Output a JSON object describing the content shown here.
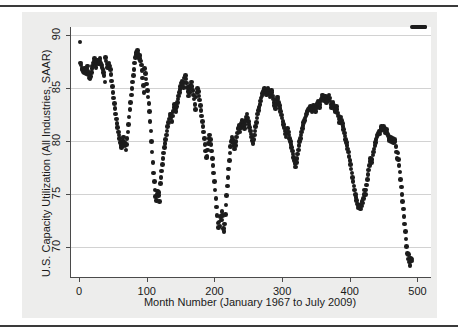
{
  "figure": {
    "background_color": "#ededec",
    "plot_background_color": "#ffffff",
    "axis_color": "#4a4a4a",
    "grid_color": "#d2d2d2",
    "marker_color": "#1c1c1c",
    "top_rule_color": "#3a3a3a",
    "bottom_rule_color": "#3a3a3a"
  },
  "chart_data": {
    "type": "scatter",
    "title": "",
    "xlabel": "Month Number (January 1967 to July 2009)",
    "ylabel": "U.S. Capacity Utilization  (All Industries, SAAR)",
    "xlim": [
      -12,
      520
    ],
    "ylim": [
      67.2,
      90.8
    ],
    "xticks": [
      0,
      100,
      200,
      300,
      400,
      500
    ],
    "xticklabels": [
      "0",
      "100",
      "200",
      "300",
      "400",
      "500"
    ],
    "yticks": [
      70,
      75,
      80,
      85,
      90
    ],
    "yticklabels": [
      "70",
      "75",
      "80",
      "85",
      "90"
    ],
    "grid": "horizontal",
    "legend": "none",
    "marker": "filled-circle",
    "n_points": 511,
    "x": [
      1,
      2,
      3,
      4,
      5,
      6,
      7,
      8,
      9,
      10,
      11,
      12,
      13,
      14,
      15,
      16,
      17,
      18,
      19,
      20,
      21,
      22,
      23,
      24,
      25,
      26,
      27,
      28,
      29,
      30,
      31,
      32,
      33,
      34,
      35,
      36,
      37,
      38,
      39,
      40,
      41,
      42,
      43,
      44,
      45,
      46,
      47,
      48,
      49,
      50,
      51,
      52,
      53,
      54,
      55,
      56,
      57,
      58,
      59,
      60,
      61,
      62,
      63,
      64,
      65,
      66,
      67,
      68,
      69,
      70,
      71,
      72,
      73,
      74,
      75,
      76,
      77,
      78,
      79,
      80,
      81,
      82,
      83,
      84,
      85,
      86,
      87,
      88,
      89,
      90,
      91,
      92,
      93,
      94,
      95,
      96,
      97,
      98,
      99,
      100,
      101,
      102,
      103,
      104,
      105,
      106,
      107,
      108,
      109,
      110,
      111,
      112,
      113,
      114,
      115,
      116,
      117,
      118,
      119,
      120,
      121,
      122,
      123,
      124,
      125,
      126,
      127,
      128,
      129,
      130,
      131,
      132,
      133,
      134,
      135,
      136,
      137,
      138,
      139,
      140,
      141,
      142,
      143,
      144,
      145,
      146,
      147,
      148,
      149,
      150,
      151,
      152,
      153,
      154,
      155,
      156,
      157,
      158,
      159,
      160,
      161,
      162,
      163,
      164,
      165,
      166,
      167,
      168,
      169,
      170,
      171,
      172,
      173,
      174,
      175,
      176,
      177,
      178,
      179,
      180,
      181,
      182,
      183,
      184,
      185,
      186,
      187,
      188,
      189,
      190,
      191,
      192,
      193,
      194,
      195,
      196,
      197,
      198,
      199,
      200,
      201,
      202,
      203,
      204,
      205,
      206,
      207,
      208,
      209,
      210,
      211,
      212,
      213,
      214,
      215,
      216,
      217,
      218,
      219,
      220,
      221,
      222,
      223,
      224,
      225,
      226,
      227,
      228,
      229,
      230,
      231,
      232,
      233,
      234,
      235,
      236,
      237,
      238,
      239,
      240,
      241,
      242,
      243,
      244,
      245,
      246,
      247,
      248,
      249,
      250,
      251,
      252,
      253,
      254,
      255,
      256,
      257,
      258,
      259,
      260,
      261,
      262,
      263,
      264,
      265,
      266,
      267,
      268,
      269,
      270,
      271,
      272,
      273,
      274,
      275,
      276,
      277,
      278,
      279,
      280,
      281,
      282,
      283,
      284,
      285,
      286,
      287,
      288,
      289,
      290,
      291,
      292,
      293,
      294,
      295,
      296,
      297,
      298,
      299,
      300,
      301,
      302,
      303,
      304,
      305,
      306,
      307,
      308,
      309,
      310,
      311,
      312,
      313,
      314,
      315,
      316,
      317,
      318,
      319,
      320,
      321,
      322,
      323,
      324,
      325,
      326,
      327,
      328,
      329,
      330,
      331,
      332,
      333,
      334,
      335,
      336,
      337,
      338,
      339,
      340,
      341,
      342,
      343,
      344,
      345,
      346,
      347,
      348,
      349,
      350,
      351,
      352,
      353,
      354,
      355,
      356,
      357,
      358,
      359,
      360,
      361,
      362,
      363,
      364,
      365,
      366,
      367,
      368,
      369,
      370,
      371,
      372,
      373,
      374,
      375,
      376,
      377,
      378,
      379,
      380,
      381,
      382,
      383,
      384,
      385,
      386,
      387,
      388,
      389,
      390,
      391,
      392,
      393,
      394,
      395,
      396,
      397,
      398,
      399,
      400,
      401,
      402,
      403,
      404,
      405,
      406,
      407,
      408,
      409,
      410,
      411,
      412,
      413,
      414,
      415,
      416,
      417,
      418,
      419,
      420,
      421,
      422,
      423,
      424,
      425,
      426,
      427,
      428,
      429,
      430,
      431,
      432,
      433,
      434,
      435,
      436,
      437,
      438,
      439,
      440,
      441,
      442,
      443,
      444,
      445,
      446,
      447,
      448,
      449,
      450,
      451,
      452,
      453,
      454,
      455,
      456,
      457,
      458,
      459,
      460,
      461,
      462,
      463,
      464,
      465,
      466,
      467,
      468,
      469,
      470,
      471,
      472,
      473,
      474,
      475,
      476,
      477,
      478,
      479,
      480,
      481,
      482,
      483,
      484,
      485,
      486,
      487,
      488,
      489,
      490,
      491,
      492,
      493,
      494,
      495,
      496,
      497,
      498,
      499,
      500,
      501,
      502,
      503,
      504,
      505,
      506,
      507,
      508,
      509,
      510,
      511
    ],
    "y": [
      89.4,
      87.4,
      87.2,
      86.9,
      86.8,
      86.6,
      86.5,
      86.9,
      86.7,
      86.4,
      86.9,
      87.1,
      86.6,
      86.3,
      86.0,
      85.9,
      86.1,
      86.5,
      86.9,
      87.1,
      87.4,
      87.6,
      87.8,
      87.3,
      87.0,
      87.4,
      87.7,
      87.5,
      87.3,
      87.6,
      87.8,
      87.4,
      87.2,
      87.0,
      86.8,
      86.5,
      86.2,
      85.6,
      87.9,
      87.6,
      87.3,
      87.0,
      87.2,
      87.4,
      87.1,
      86.8,
      86.3,
      85.7,
      85.2,
      84.6,
      84.1,
      83.6,
      83.1,
      82.6,
      82.1,
      81.7,
      81.3,
      80.9,
      80.6,
      80.3,
      79.9,
      79.6,
      79.4,
      79.7,
      80.1,
      80.4,
      79.9,
      79.6,
      79.2,
      79.7,
      80.3,
      80.9,
      81.6,
      82.3,
      83.0,
      83.7,
      84.4,
      85.0,
      85.6,
      86.2,
      86.8,
      87.4,
      87.9,
      88.2,
      88.4,
      88.6,
      88.3,
      88.0,
      87.8,
      88.1,
      87.6,
      87.2,
      86.7,
      86.0,
      85.3,
      84.6,
      86.9,
      86.4,
      85.9,
      85.4,
      84.8,
      84.2,
      83.6,
      82.8,
      81.9,
      81.0,
      80.0,
      79.0,
      78.0,
      77.0,
      76.2,
      75.4,
      74.8,
      74.4,
      75.0,
      75.3,
      74.9,
      75.2,
      74.3,
      76.0,
      76.6,
      77.2,
      77.8,
      78.4,
      78.9,
      79.4,
      79.8,
      80.2,
      80.6,
      81.0,
      81.4,
      81.8,
      82.1,
      82.4,
      82.6,
      82.2,
      81.9,
      82.4,
      82.8,
      83.2,
      83.5,
      83.1,
      82.8,
      83.3,
      83.7,
      84.0,
      84.3,
      84.6,
      84.9,
      85.2,
      85.5,
      85.7,
      85.4,
      85.1,
      85.6,
      86.0,
      86.2,
      85.9,
      85.5,
      85.1,
      84.7,
      84.3,
      84.6,
      85.0,
      85.3,
      85.6,
      85.2,
      84.8,
      84.4,
      84.0,
      83.5,
      83.0,
      84.2,
      84.6,
      85.0,
      84.7,
      84.3,
      83.9,
      83.4,
      82.9,
      82.4,
      81.9,
      81.4,
      80.9,
      80.3,
      79.7,
      79.1,
      78.5,
      78.6,
      79.2,
      79.8,
      80.3,
      80.6,
      80.2,
      79.7,
      79.1,
      78.4,
      77.7,
      77.0,
      76.2,
      75.4,
      74.6,
      73.8,
      73.0,
      72.3,
      71.9,
      72.4,
      72.0,
      72.9,
      72.6,
      73.4,
      73.0,
      71.8,
      71.5,
      72.2,
      73.1,
      74.0,
      74.9,
      75.8,
      76.6,
      77.4,
      78.2,
      78.9,
      79.5,
      80.0,
      80.4,
      80.2,
      79.9,
      79.6,
      79.3,
      79.6,
      80.0,
      80.4,
      80.8,
      81.2,
      81.5,
      81.2,
      80.9,
      81.3,
      81.7,
      82.0,
      81.8,
      81.5,
      81.2,
      81.6,
      82.0,
      82.3,
      82.6,
      82.2,
      81.9,
      81.6,
      81.3,
      81.0,
      80.7,
      80.4,
      80.1,
      79.8,
      80.2,
      80.6,
      81.0,
      81.4,
      81.8,
      82.2,
      82.6,
      82.9,
      83.2,
      83.5,
      83.8,
      84.1,
      84.3,
      84.5,
      84.7,
      84.9,
      85.0,
      84.8,
      84.6,
      84.4,
      84.7,
      85.0,
      84.8,
      84.5,
      84.2,
      84.5,
      84.8,
      84.6,
      84.3,
      84.0,
      83.7,
      83.4,
      83.1,
      83.5,
      83.9,
      84.2,
      84.0,
      83.7,
      83.4,
      83.1,
      82.8,
      82.5,
      82.2,
      81.9,
      81.6,
      81.3,
      81.0,
      80.7,
      80.4,
      80.8,
      81.2,
      80.9,
      80.6,
      80.3,
      80.0,
      79.7,
      79.4,
      79.1,
      78.8,
      78.5,
      78.2,
      77.9,
      77.6,
      78.0,
      78.4,
      78.8,
      79.2,
      79.6,
      80.0,
      80.3,
      80.6,
      80.9,
      81.2,
      81.5,
      81.8,
      82.0,
      82.2,
      82.4,
      82.6,
      82.8,
      82.9,
      83.0,
      83.1,
      83.2,
      83.3,
      83.0,
      82.8,
      83.1,
      83.4,
      83.2,
      83.0,
      82.8,
      83.1,
      83.4,
      83.6,
      83.8,
      83.5,
      83.2,
      83.5,
      83.8,
      84.0,
      84.2,
      84.4,
      84.1,
      83.8,
      84.1,
      84.3,
      84.0,
      83.7,
      83.9,
      84.2,
      84.4,
      84.1,
      83.8,
      83.5,
      83.2,
      83.4,
      83.7,
      83.4,
      83.1,
      82.8,
      83.0,
      83.3,
      83.0,
      82.7,
      82.4,
      82.1,
      81.8,
      82.0,
      82.3,
      82.0,
      81.7,
      81.4,
      81.1,
      80.8,
      80.5,
      80.2,
      79.9,
      79.6,
      79.3,
      79.0,
      78.6,
      78.2,
      77.8,
      77.4,
      77.0,
      76.6,
      76.2,
      75.8,
      75.4,
      75.0,
      74.7,
      74.4,
      74.1,
      73.9,
      73.7,
      73.8,
      74.0,
      73.6,
      73.9,
      74.3,
      74.2,
      74.6,
      75.0,
      75.4,
      75.0,
      75.4,
      75.9,
      76.4,
      76.9,
      77.3,
      77.7,
      78.1,
      78.4,
      78.0,
      78.3,
      78.7,
      79.0,
      79.3,
      79.6,
      79.9,
      80.2,
      80.4,
      80.6,
      80.8,
      81.0,
      80.7,
      81.0,
      81.2,
      81.4,
      81.3,
      81.1,
      81.4,
      81.2,
      81.0,
      80.8,
      81.1,
      80.9,
      80.7,
      80.5,
      80.3,
      80.1,
      80.4,
      80.2,
      80.0,
      80.3,
      80.1,
      79.9,
      80.2,
      80.0,
      79.5,
      79.0,
      78.4,
      78.9,
      78.3,
      77.7,
      77.1,
      76.4,
      75.7,
      75.0,
      74.3,
      73.6,
      72.9,
      72.2,
      71.5,
      70.8,
      70.1,
      69.4,
      68.9,
      69.3,
      68.6,
      68.3,
      69.0,
      68.7,
      68.9
    ]
  }
}
